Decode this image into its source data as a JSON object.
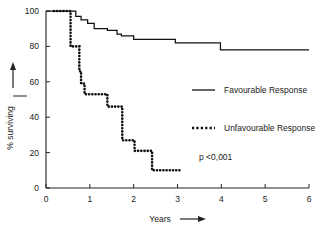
{
  "chart_data": {
    "type": "line",
    "title": "",
    "subtitle": "",
    "xlabel": "Years",
    "ylabel": "% surviving",
    "xlim": [
      0,
      6
    ],
    "ylim": [
      0,
      100
    ],
    "grid": false,
    "x_ticks": [
      0,
      1,
      2,
      3,
      4,
      5,
      6
    ],
    "x_tick_labels": [
      "0",
      "1",
      "2",
      "3",
      "4",
      "5",
      "6"
    ],
    "y_ticks": [
      0,
      20,
      40,
      60,
      80,
      100
    ],
    "y_tick_labels": [
      "0",
      "20",
      "40",
      "60",
      "80",
      "100"
    ],
    "legend_position": "center-right",
    "annotations": [
      {
        "text": "p <0,001",
        "x": 3.1,
        "y": 27
      }
    ],
    "series": [
      {
        "name": "Favourable Response",
        "style": "solid",
        "color": "#111111",
        "steps": [
          {
            "x": 0.0,
            "y": 100
          },
          {
            "x": 0.62,
            "y": 100
          },
          {
            "x": 0.68,
            "y": 97
          },
          {
            "x": 0.8,
            "y": 95
          },
          {
            "x": 0.95,
            "y": 93
          },
          {
            "x": 1.1,
            "y": 90
          },
          {
            "x": 1.4,
            "y": 89
          },
          {
            "x": 1.62,
            "y": 87
          },
          {
            "x": 1.72,
            "y": 86
          },
          {
            "x": 2.0,
            "y": 84
          },
          {
            "x": 2.95,
            "y": 82
          },
          {
            "x": 3.98,
            "y": 78
          },
          {
            "x": 6.0,
            "y": 78
          }
        ]
      },
      {
        "name": "Unfavourable Response",
        "style": "dotted",
        "color": "#111111",
        "steps": [
          {
            "x": 0.18,
            "y": 100
          },
          {
            "x": 0.52,
            "y": 100
          },
          {
            "x": 0.56,
            "y": 80
          },
          {
            "x": 0.72,
            "y": 80
          },
          {
            "x": 0.76,
            "y": 66
          },
          {
            "x": 0.8,
            "y": 59
          },
          {
            "x": 0.88,
            "y": 53
          },
          {
            "x": 1.35,
            "y": 53
          },
          {
            "x": 1.4,
            "y": 46
          },
          {
            "x": 1.7,
            "y": 46
          },
          {
            "x": 1.74,
            "y": 27
          },
          {
            "x": 1.98,
            "y": 27
          },
          {
            "x": 2.02,
            "y": 21
          },
          {
            "x": 2.38,
            "y": 21
          },
          {
            "x": 2.42,
            "y": 10
          },
          {
            "x": 3.1,
            "y": 10
          }
        ]
      }
    ]
  },
  "axes": {
    "x_axis_name": "Years",
    "y_axis_name": "% surviving",
    "x_arrow": "⟶",
    "y_arrow": "⟶"
  },
  "legend": {
    "items": [
      {
        "label": "Favourable Response",
        "style": "solid"
      },
      {
        "label": "Unfavourable Response",
        "style": "dotted"
      }
    ],
    "pvalue": "p <0,001"
  }
}
